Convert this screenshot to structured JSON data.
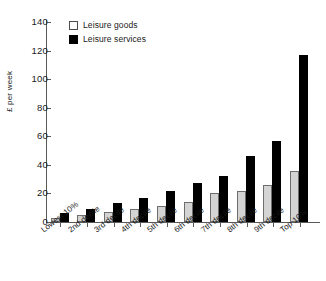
{
  "chart_data": {
    "type": "bar",
    "title": "",
    "xlabel": "",
    "ylabel": "£ per week",
    "ylim": [
      0,
      140
    ],
    "yticks": [
      0,
      20,
      40,
      60,
      80,
      100,
      120,
      140
    ],
    "grid": false,
    "legend_position": "top-left-inside",
    "categories": [
      "Lowest 10%",
      "2nd decile",
      "3rd decile",
      "4th decile",
      "5th decile",
      "6th decile",
      "7th decile",
      "8th decile",
      "9th decile",
      "Top 10%"
    ],
    "series": [
      {
        "name": "Leisure goods",
        "color": "#d4d4d4",
        "values": [
          3,
          5,
          7,
          9,
          11,
          14,
          20,
          22,
          26,
          36
        ]
      },
      {
        "name": "Leisure services",
        "color": "#000000",
        "values": [
          6,
          9,
          13,
          17,
          22,
          27,
          32,
          46,
          57,
          117
        ]
      }
    ]
  },
  "legend": {
    "items": [
      {
        "label": "Leisure goods"
      },
      {
        "label": "Leisure services"
      }
    ]
  },
  "axis": {
    "y_title": "£ per week",
    "y_tick_labels": [
      "0",
      "20",
      "40",
      "60",
      "80",
      "100",
      "120",
      "140"
    ]
  }
}
